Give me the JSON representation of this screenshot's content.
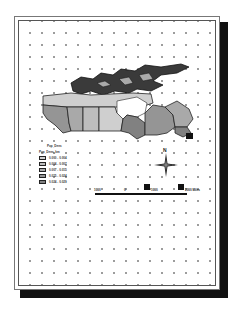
{
  "layout": {
    "page_border_color": "#555555",
    "shadow_color": "#111111",
    "grid_dot_color": "#9a9a9a"
  },
  "map": {
    "subject": "Canada provinces choropleth",
    "class_colors": [
      "#c8c8c8",
      "#b4b4b4",
      "#a0a0a0",
      "#8c8c8c",
      "#787878"
    ]
  },
  "legend": {
    "title": "Pop_Dens",
    "subtitle": "Pop_Dens_km",
    "items": [
      {
        "label": "0.000 - 0.004",
        "color": "#cfcfcf"
      },
      {
        "label": "0.004 - 0.007",
        "color": "#bdbdbd"
      },
      {
        "label": "0.007 - 0.015",
        "color": "#a9a9a9"
      },
      {
        "label": "0.015 - 0.024",
        "color": "#959595"
      },
      {
        "label": "0.024 - 0.029",
        "color": "#818181"
      }
    ]
  },
  "north_arrow": {
    "label": "N"
  },
  "scale_bar": {
    "labels": [
      "1000",
      "0",
      "1000",
      "2000 Miles"
    ]
  }
}
